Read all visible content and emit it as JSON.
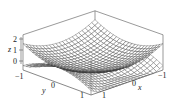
{
  "chart_data": {
    "type": "surface3d",
    "title": "",
    "xlabel": "x",
    "ylabel": "y",
    "zlabel": "z",
    "xlim": [
      -1,
      1
    ],
    "ylim": [
      -1,
      1
    ],
    "zlim": [
      -0.4,
      2.8
    ],
    "x_ticks": [
      -1,
      0,
      1
    ],
    "y_ticks": [
      -1,
      0,
      1
    ],
    "z_ticks": [
      0,
      1,
      2
    ],
    "grid": false,
    "legend": null,
    "series": [
      {
        "name": "upper-surface",
        "expression": "x^2 + y^2",
        "mesh": 22,
        "color": "#333333",
        "fill": "#ffffff"
      },
      {
        "name": "lower-surface",
        "expression": "x^2 - y^2",
        "mesh": 22,
        "color": "#444444",
        "fill": "#ffffff"
      }
    ]
  },
  "labels": {
    "x": "x",
    "y": "y",
    "z": "z",
    "z_ticks": [
      "0",
      "1",
      "2"
    ],
    "y_ticks": [
      "−1",
      "0",
      "1"
    ],
    "x_ticks": [
      "1",
      "0",
      "−1"
    ]
  },
  "colors": {
    "box": "#555555",
    "mesh": "#333333",
    "background": "#ffffff"
  }
}
